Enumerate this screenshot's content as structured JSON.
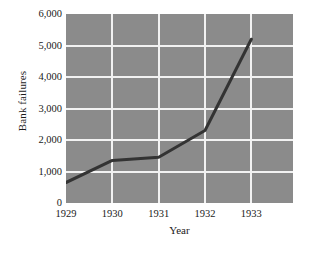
{
  "chart_data": {
    "type": "line",
    "title": "",
    "xlabel": "Year",
    "ylabel": "Bank failures",
    "x": [
      1929,
      1930,
      1931,
      1932,
      1933
    ],
    "categories": [
      "1929",
      "1930",
      "1931",
      "1932",
      "1933"
    ],
    "values": [
      650,
      1350,
      1450,
      2300,
      5200
    ],
    "series": [
      {
        "name": "Bank failures",
        "values": [
          650,
          1350,
          1450,
          2300,
          5200
        ]
      }
    ],
    "xlim": [
      1929,
      1933.9
    ],
    "ylim": [
      0,
      6000
    ],
    "ytick_values": [
      0,
      1000,
      2000,
      3000,
      4000,
      5000,
      6000
    ],
    "ytick_labels": [
      "0",
      "1,000",
      "2,000",
      "3,000",
      "4,000",
      "5,000",
      "6,000"
    ],
    "xtick_values": [
      1929,
      1930,
      1931,
      1932,
      1933
    ],
    "xtick_labels": [
      "1929",
      "1930",
      "1931",
      "1932",
      "1933"
    ],
    "grid": true,
    "grid_color": "#f2f2f2",
    "legend": false,
    "legend_position": "none",
    "plot_background": "#8b8b8b",
    "line_color": "#333333",
    "line_width": 3,
    "markers": false,
    "annotations": []
  }
}
